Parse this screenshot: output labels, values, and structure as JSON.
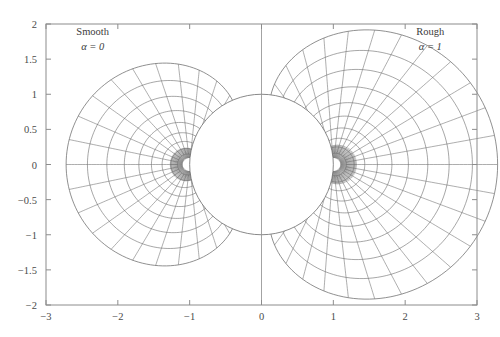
{
  "chart_data": {
    "type": "line",
    "title": "",
    "xlabel": "",
    "ylabel": "",
    "xlim": [
      -3,
      3
    ],
    "ylim": [
      -2,
      2
    ],
    "grid": false,
    "legend_position": "none",
    "xticks": [
      "-3",
      "-2",
      "-1",
      "0",
      "1",
      "2",
      "3"
    ],
    "xtick_values": [
      -3,
      -2,
      -1,
      0,
      1,
      2,
      3
    ],
    "yticks": [
      "2",
      "1.5",
      "1",
      "0.5",
      "0",
      "-0.5",
      "-1",
      "-1.5",
      "-2"
    ],
    "ytick_values": [
      2,
      1.5,
      1,
      0.5,
      0,
      -0.5,
      -1,
      -1.5,
      -2
    ],
    "annotations": [
      {
        "name": "smooth",
        "title": "Smooth",
        "subtitle": "α = 0",
        "alpha_symbol": "α",
        "alpha_value": "0",
        "x": -2.35,
        "y": 1.78
      },
      {
        "name": "rough",
        "title": "Rough",
        "subtitle": "α = 1",
        "alpha_symbol": "α",
        "alpha_value": "1",
        "x": 2.35,
        "y": 1.78
      }
    ],
    "series": [
      {
        "name": "unit-circle",
        "kind": "circle",
        "center": [
          0,
          0
        ],
        "radius": 1.0
      },
      {
        "name": "vertical-axis-line",
        "kind": "segment",
        "x": 0,
        "y_from": -2,
        "y_to": 2
      },
      {
        "name": "smooth-mesh",
        "kind": "polar-mesh",
        "focus": [
          -1,
          0
        ],
        "direction": -1,
        "alpha": 0,
        "radial_rings": [
          1.05,
          1.12,
          1.21,
          1.32,
          1.45,
          1.6,
          1.78,
          1.98,
          2.2
        ],
        "ray_count": 28,
        "max_radius": 2.2,
        "outer_extent_x": -2.25,
        "outer_extent_y": 1.27
      },
      {
        "name": "rough-mesh",
        "kind": "polar-mesh",
        "focus": [
          1,
          0
        ],
        "direction": 1,
        "alpha": 1,
        "radial_rings": [
          1.06,
          1.14,
          1.25,
          1.38,
          1.53,
          1.7,
          1.9,
          2.12,
          2.36,
          2.62
        ],
        "ray_count": 32,
        "max_radius": 2.62,
        "outer_extent_x": 2.8,
        "outer_extent_y": 1.82
      }
    ],
    "colors": {
      "grid_line": "#6b6b6b",
      "frame": "#8c8c8c",
      "circle": "#6b6b6b",
      "text": "#4a4a4a",
      "background": "#ffffff"
    }
  },
  "axes": {
    "frame_name": "plot-frame"
  }
}
